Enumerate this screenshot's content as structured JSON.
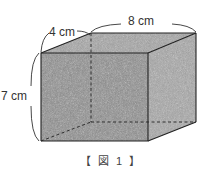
{
  "figure": {
    "caption": "【 図 1 】",
    "shape": "rectangular prism (cuboid)",
    "fill_color": "#9a9a9a",
    "edge_color": "#222222",
    "dimensions": {
      "depth_label": "4 cm",
      "width_label": "8 cm",
      "height_label": "7 cm"
    }
  }
}
